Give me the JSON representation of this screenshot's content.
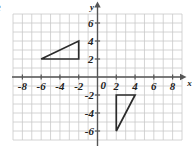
{
  "figure": {
    "corner_fragment": "e",
    "axis_labels": {
      "x": "x",
      "y": "y"
    },
    "origin_label": "0"
  },
  "colors": {
    "grid": "#c9c9c9",
    "axis": "#555555",
    "shape_stroke": "#2b2b2b",
    "label_text": "#222222",
    "background": "#ffffff"
  },
  "chart_data": {
    "type": "scatter",
    "title": "",
    "xlabel": "x",
    "ylabel": "y",
    "xlim": [
      -9,
      9
    ],
    "ylim": [
      -7,
      7
    ],
    "grid": true,
    "legend": "none",
    "x_ticks": [
      -8,
      -6,
      -4,
      -2,
      2,
      4,
      6,
      8
    ],
    "x_tick_labels": [
      "-8",
      "-6",
      "-4",
      "-2",
      "2",
      "4",
      "6",
      "8"
    ],
    "y_ticks": [
      6,
      4,
      2,
      -2,
      -4,
      -6
    ],
    "y_tick_labels": [
      "6",
      "4",
      "2",
      "-2",
      "-4",
      "-6"
    ],
    "grid_step": 1,
    "tick_step": 2,
    "shapes": [
      {
        "name": "upper-left-triangle",
        "type": "polygon",
        "vertices": [
          [
            -6,
            2
          ],
          [
            -2,
            2
          ],
          [
            -2,
            4
          ]
        ],
        "fill": "none",
        "stroke": "#2b2b2b"
      },
      {
        "name": "lower-right-triangle",
        "type": "polygon",
        "vertices": [
          [
            2,
            -2
          ],
          [
            4,
            -2
          ],
          [
            2,
            -6
          ]
        ],
        "fill": "none",
        "stroke": "#2b2b2b"
      }
    ]
  }
}
